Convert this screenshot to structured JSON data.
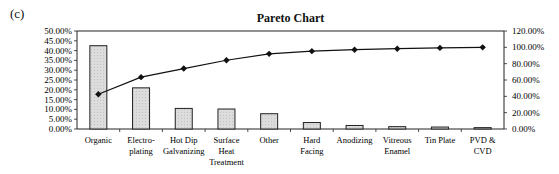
{
  "panel_label": "(c)",
  "chart_data": {
    "type": "bar",
    "title": "Pareto Chart",
    "xlabel": "",
    "ylabel": "",
    "categories": [
      "Organic",
      "Electro-plating",
      "Hot Dip Galvanizing",
      "Surface Heat Treatment",
      "Other",
      "Hard Facing",
      "Anodizing",
      "Vitreous Enamel",
      "Tin Plate",
      "PVD & CVD"
    ],
    "category_lines": [
      [
        "Organic"
      ],
      [
        "Electro-",
        "plating"
      ],
      [
        "Hot Dip",
        "Galvanizing"
      ],
      [
        "Surface",
        "Heat",
        "Treatment"
      ],
      [
        "Other"
      ],
      [
        "Hard",
        "Facing"
      ],
      [
        "Anodizing"
      ],
      [
        "Vitreous",
        "Enamel"
      ],
      [
        "Tin Plate"
      ],
      [
        "PVD &",
        "CVD"
      ]
    ],
    "series": [
      {
        "name": "Percentage",
        "type": "bar",
        "axis": "left",
        "values": [
          42.5,
          21.0,
          10.5,
          10.2,
          7.8,
          3.3,
          1.8,
          1.2,
          1.0,
          0.7
        ]
      },
      {
        "name": "Cumulative Percentage",
        "type": "line",
        "axis": "right",
        "values": [
          42.5,
          63.5,
          74.0,
          84.2,
          92.0,
          95.3,
          97.1,
          98.3,
          99.3,
          100.0
        ]
      }
    ],
    "ylim": [
      0,
      50
    ],
    "y2lim": [
      0,
      120
    ],
    "left_ticks": [
      "0.00%",
      "5.00%",
      "10.00%",
      "15.00%",
      "20.00%",
      "25.00%",
      "30.00%",
      "35.00%",
      "40.00%",
      "45.00%",
      "50.00%"
    ],
    "right_ticks": [
      "0.00%",
      "20.00%",
      "40.00%",
      "60.00%",
      "80.00%",
      "100.00%",
      "120.00%"
    ],
    "grid": false,
    "legend": "none",
    "colors": {
      "bar_fill": "#d9d9d9",
      "bar_stroke": "#222222",
      "line": "#111111",
      "axis": "#222222"
    }
  }
}
